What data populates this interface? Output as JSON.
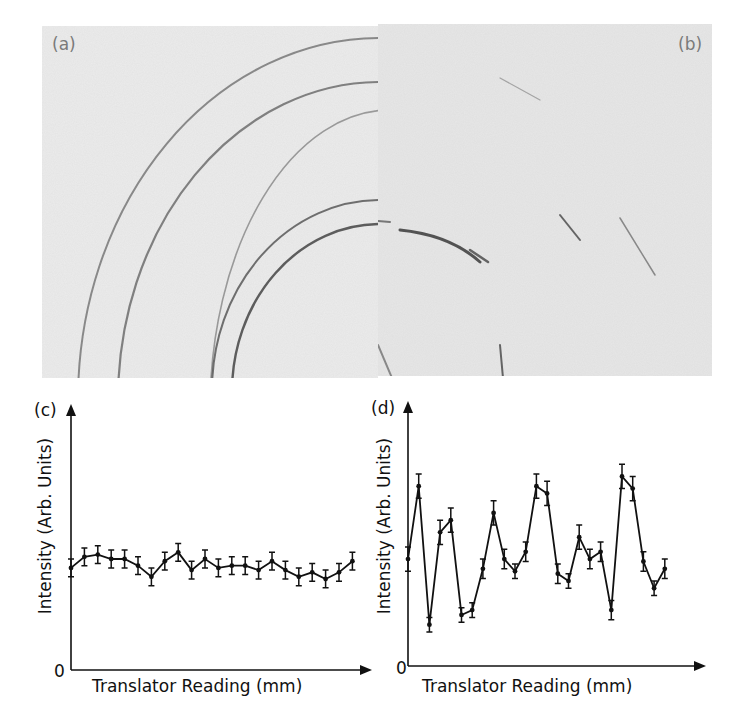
{
  "figure": {
    "panels": {
      "a": {
        "label": "(a)"
      },
      "b": {
        "label": "(b)"
      }
    },
    "colors": {
      "background": "#ffffff",
      "film": "#e9e9e9",
      "film_left": "#ececec",
      "ring": "#3a3a3a",
      "line": "#111111",
      "panel_label": "#7a7a7a"
    }
  },
  "chart_data": [
    {
      "panel": "(c)",
      "type": "line",
      "title": "",
      "xlabel": "Translator Reading (mm)",
      "ylabel": "Intensity (Arb. Units)",
      "origin_label": "0",
      "ylim": [
        0,
        100
      ],
      "error_bars": true,
      "grid": false,
      "x": [
        1,
        2,
        3,
        4,
        5,
        6,
        7,
        8,
        9,
        10,
        11,
        12,
        13,
        14,
        15,
        16,
        17,
        18,
        19,
        20,
        21,
        22
      ],
      "values": [
        46,
        51,
        52,
        50,
        50,
        47,
        42,
        49,
        53,
        45,
        50,
        46,
        47,
        47,
        45,
        49,
        45,
        42,
        44,
        41,
        44,
        49
      ],
      "error": [
        4,
        4,
        4,
        4,
        4,
        4,
        4,
        4,
        4,
        4,
        4,
        4,
        4,
        4,
        4,
        4,
        4,
        4,
        4,
        4,
        4,
        4
      ]
    },
    {
      "panel": "(d)",
      "type": "line",
      "title": "",
      "xlabel": "Translator Reading (mm)",
      "ylabel": "Intensity (Arb. Units)",
      "origin_label": "0",
      "ylim": [
        0,
        100
      ],
      "error_bars": true,
      "grid": false,
      "x": [
        1,
        2,
        3,
        4,
        5,
        6,
        7,
        8,
        9,
        10,
        11,
        12,
        13,
        14,
        15,
        16,
        17,
        18,
        19,
        20,
        21,
        22,
        23,
        24,
        25
      ],
      "values": [
        44,
        74,
        17,
        55,
        60,
        21,
        23,
        40,
        63,
        44,
        39,
        47,
        74,
        71,
        38,
        35,
        53,
        44,
        47,
        23,
        78,
        73,
        43,
        32,
        40
      ],
      "error": [
        5,
        5,
        3,
        5,
        5,
        3,
        3,
        4,
        5,
        4,
        3,
        4,
        5,
        5,
        4,
        3,
        5,
        4,
        4,
        4,
        5,
        5,
        4,
        3,
        4
      ]
    }
  ]
}
